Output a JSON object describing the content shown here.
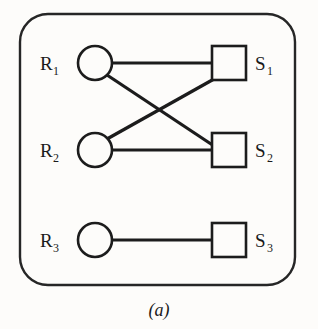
{
  "figure": {
    "caption": "(a)",
    "enclosure": {
      "name": "rounded-boundary",
      "x": 20,
      "y": 14,
      "width": 275,
      "height": 271,
      "radius": 28,
      "stroke_color": "#262626"
    },
    "resource_nodes": [
      {
        "id": "R1",
        "label": "R",
        "subscript": "1",
        "shape": "circle",
        "cx": 95,
        "cy": 63,
        "r": 17,
        "label_x": 40,
        "label_y": 70,
        "sub_x": 57,
        "sub_y": 75
      },
      {
        "id": "R2",
        "label": "R",
        "subscript": "2",
        "shape": "circle",
        "cx": 95,
        "cy": 150,
        "r": 17,
        "label_x": 40,
        "label_y": 157,
        "sub_x": 57,
        "sub_y": 162
      },
      {
        "id": "R3",
        "label": "R",
        "subscript": "3",
        "shape": "circle",
        "cx": 95,
        "cy": 240,
        "r": 17,
        "label_x": 40,
        "label_y": 247,
        "sub_x": 57,
        "sub_y": 252
      }
    ],
    "site_nodes": [
      {
        "id": "S1",
        "label": "S",
        "subscript": "1",
        "shape": "square",
        "x": 212,
        "y": 46,
        "size": 34,
        "label_x": 255,
        "label_y": 70,
        "sub_x": 269,
        "sub_y": 75
      },
      {
        "id": "S2",
        "label": "S",
        "subscript": "2",
        "shape": "square",
        "x": 212,
        "y": 133,
        "size": 34,
        "label_x": 255,
        "label_y": 157,
        "sub_x": 269,
        "sub_y": 162
      },
      {
        "id": "S3",
        "label": "S",
        "subscript": "3",
        "shape": "square",
        "x": 212,
        "y": 223,
        "size": 34,
        "label_x": 255,
        "label_y": 247,
        "sub_x": 269,
        "sub_y": 252
      }
    ],
    "edges": [
      {
        "id": "R1-S1",
        "from": "R1",
        "to": "S1",
        "x1": 112,
        "y1": 63,
        "x2": 212,
        "y2": 63
      },
      {
        "id": "R1-S2",
        "from": "R1",
        "to": "S2",
        "x1": 107,
        "y1": 75,
        "x2": 214,
        "y2": 146
      },
      {
        "id": "R2-S1",
        "from": "R2",
        "to": "S1",
        "x1": 107,
        "y1": 139,
        "x2": 214,
        "y2": 79
      },
      {
        "id": "R2-S2",
        "from": "R2",
        "to": "S2",
        "x1": 112,
        "y1": 150,
        "x2": 212,
        "y2": 150
      },
      {
        "id": "R3-S3",
        "from": "R3",
        "to": "S3",
        "x1": 112,
        "y1": 240,
        "x2": 212,
        "y2": 240
      }
    ],
    "caption_x": 159,
    "caption_y": 315,
    "stroke_color": "#1c1c1c",
    "node_fill": "#fdfcfa",
    "background_color": "#fdfcfa"
  }
}
